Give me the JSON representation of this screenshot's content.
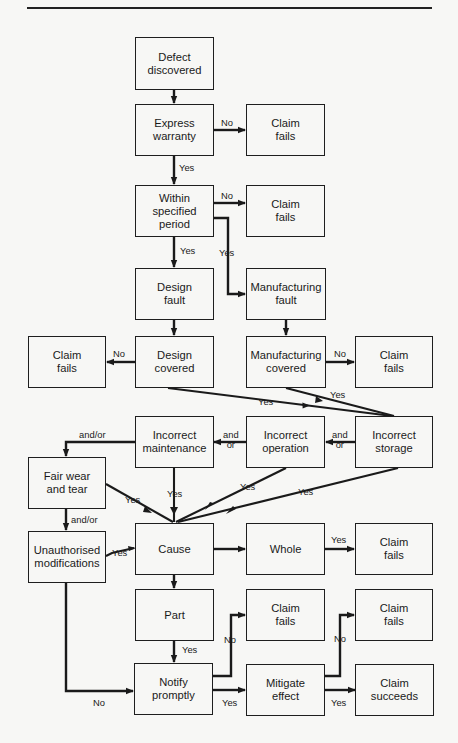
{
  "header": {
    "caption": "Figure: Flowchart of a warranty claim"
  },
  "nodes": {
    "defect_discovered": "Defect\ndiscovered",
    "express_warranty": "Express\nwarranty",
    "claim_fails_1": "Claim\nfails",
    "within_period": "Within\nspecified\nperiod",
    "claim_fails_2": "Claim\nfails",
    "design_fault": "Design\nfault",
    "manufacturing_fault": "Manufacturing\nfault",
    "claim_fails_3": "Claim\nfails",
    "design_covered": "Design\ncovered",
    "manufacturing_covered": "Manufacturing\ncovered",
    "claim_fails_4": "Claim\nfails",
    "incorrect_maintenance": "Incorrect\nmaintenance",
    "incorrect_operation": "Incorrect\noperation",
    "incorrect_storage": "Incorrect\nstorage",
    "fair_wear": "Fair wear\nand tear",
    "unauthorised_mods": "Unauthorised\nmodifications",
    "cause": "Cause",
    "whole": "Whole",
    "claim_fails_5": "Claim\nfails",
    "part": "Part",
    "claim_fails_6": "Claim\nfails",
    "claim_fails_7": "Claim\nfails",
    "notify_promptly": "Notify\npromptly",
    "mitigate_effect": "Mitigate\neffect",
    "claim_succeeds": "Claim\nsucceeds"
  },
  "labels": {
    "ew_no": "No",
    "ew_yes": "Yes",
    "wp_no": "No",
    "wp_yes_design": "Yes",
    "wp_yes_mfg": "Yes",
    "dc_no": "No",
    "mc_no": "No",
    "dc_yes": "Yes",
    "mc_yes": "Yes",
    "storage_andor": "and\nor",
    "operation_andor": "and\nor",
    "maintenance_andor": "and/or",
    "fairwear_andor": "and/or",
    "fairwear_yes": "Yes",
    "maintenance_yes": "Yes",
    "operation_yes": "Yes",
    "storage_yes": "Yes",
    "unauth_yes": "Yes",
    "whole_yes": "Yes",
    "part_yes": "Yes",
    "unauth_no": "No",
    "notify_no": "No",
    "notify_yes": "Yes",
    "mitigate_no": "No",
    "mitigate_yes": "Yes"
  }
}
